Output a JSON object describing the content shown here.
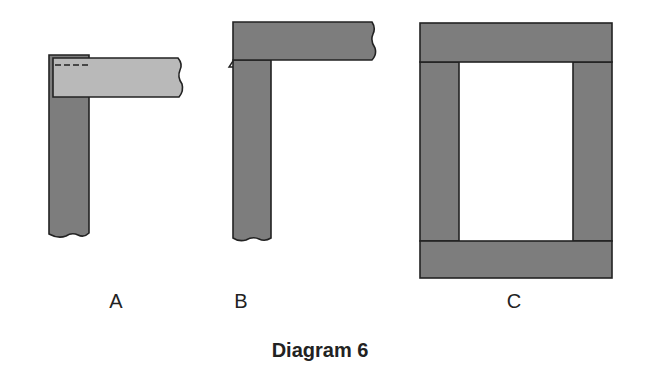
{
  "diagram": {
    "caption": "Diagram 6",
    "colors": {
      "dark_wood": "#7d7d7d",
      "light_wood": "#b9b9b9",
      "outline": "#222222",
      "background": "#ffffff"
    },
    "figures": [
      {
        "id": "A",
        "label": "A",
        "description": "Corner joint: lighter horizontal rail overlapping a darker vertical stile, with dashed hidden line at top"
      },
      {
        "id": "B",
        "label": "B",
        "description": "Corner joint: darker horizontal rail sitting on top of darker vertical stile"
      },
      {
        "id": "C",
        "label": "C",
        "description": "Complete rectangular frame: top and bottom rails spanning full width, two stiles between them, open center"
      }
    ]
  }
}
